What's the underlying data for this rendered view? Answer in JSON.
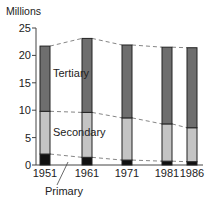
{
  "chart_data": {
    "type": "bar",
    "stacked": true,
    "title": "",
    "xlabel": "",
    "ylabel": "Millions",
    "ylim": [
      0,
      25
    ],
    "yticks": [
      0,
      5,
      10,
      15,
      20,
      25
    ],
    "grid": false,
    "categories": [
      "1951",
      "1961",
      "1971",
      "1981",
      "1986"
    ],
    "series": [
      {
        "name": "Primary",
        "values": [
          2.0,
          1.4,
          0.9,
          0.7,
          0.6
        ],
        "color": "#111111"
      },
      {
        "name": "Secondary",
        "values": [
          7.8,
          8.2,
          7.7,
          6.8,
          6.2
        ],
        "color": "#c4c4c4"
      },
      {
        "name": "Tertiary",
        "values": [
          11.9,
          13.5,
          13.3,
          14.0,
          14.6
        ],
        "color": "#6e6e6e"
      }
    ],
    "totals": [
      21.7,
      23.1,
      21.9,
      21.5,
      21.4
    ],
    "annotations": [
      "Tertiary",
      "Secondary",
      "Primary"
    ],
    "legend_position": "inline labels",
    "connector_lines": "dashed lines joining segment boundaries between bars"
  },
  "labels": {
    "y_axis_title": "Millions",
    "tertiary": "Tertiary",
    "secondary": "Secondary",
    "primary": "Primary"
  }
}
